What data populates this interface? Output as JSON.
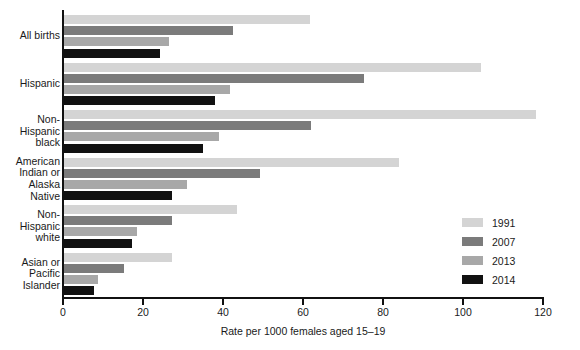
{
  "chart_data": {
    "type": "bar",
    "orientation": "horizontal",
    "title": "",
    "xlabel": "Rate per 1000 females aged 15–19",
    "ylabel": "",
    "xlim": [
      0,
      120
    ],
    "xticks": [
      0,
      20,
      40,
      60,
      80,
      100,
      120
    ],
    "xtick_labels": [
      "0",
      "20",
      "40",
      "60",
      "80",
      "100",
      "120"
    ],
    "grid": false,
    "legend_position": "right",
    "categories": [
      "All births",
      "Hispanic",
      "Non-\nHispanic\nblack",
      "American\nIndian or\nAlaska\nNative",
      "Non-\nHispanic\nwhite",
      "Asian or\nPacific\nIslander"
    ],
    "category_lines": [
      [
        "All births"
      ],
      [
        "Hispanic"
      ],
      [
        "Non-",
        "Hispanic",
        "black"
      ],
      [
        "American",
        "Indian or",
        "Alaska",
        "Native"
      ],
      [
        "Non-",
        "Hispanic",
        "white"
      ],
      [
        "Asian or",
        "Pacific",
        "Islander"
      ]
    ],
    "series": [
      {
        "name": "1991",
        "color": "#d4d4d4",
        "values": [
          61.8,
          104.6,
          118.2,
          84.1,
          43.4,
          27.3
        ]
      },
      {
        "name": "2007",
        "color": "#7b7b7b",
        "values": [
          42.5,
          75.3,
          61.9,
          49.3,
          27.2,
          15.2
        ]
      },
      {
        "name": "2013",
        "color": "#a8a8a8",
        "values": [
          26.5,
          41.7,
          39.0,
          31.0,
          18.6,
          8.7
        ]
      },
      {
        "name": "2014",
        "color": "#111111",
        "values": [
          24.2,
          38.0,
          34.9,
          27.3,
          17.3,
          7.7
        ]
      }
    ]
  },
  "legend": {
    "items": [
      {
        "label": "1991",
        "color": "#d4d4d4"
      },
      {
        "label": "2007",
        "color": "#7b7b7b"
      },
      {
        "label": "2013",
        "color": "#a8a8a8"
      },
      {
        "label": "2014",
        "color": "#111111"
      }
    ]
  },
  "axis": {
    "x_title": "Rate per 1000 females aged 15–19"
  }
}
